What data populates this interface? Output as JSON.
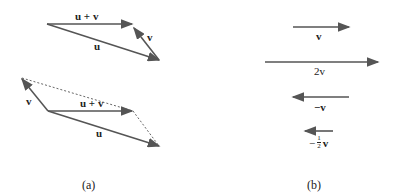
{
  "panel_a": {
    "caption": "(a)",
    "top": {
      "u_label": "u",
      "v_label": "v",
      "sum_label": "u + v"
    },
    "bottom": {
      "u_label": "u",
      "v_label": "v",
      "sum_label": "u + v"
    }
  },
  "panel_b": {
    "caption": "(b)",
    "v_label": "v",
    "two_v_label": "2v",
    "neg_v_label": "−v",
    "neg_half_prefix": "−",
    "half_num": "1",
    "half_den": "2",
    "neg_half_v": "v"
  },
  "colors": {
    "arrow": "#555555",
    "dotted": "#666666",
    "text": "#222222"
  }
}
